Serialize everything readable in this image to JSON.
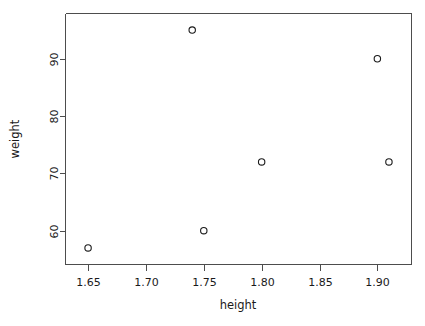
{
  "chart_data": {
    "type": "scatter",
    "title": "",
    "xlabel": "height",
    "ylabel": "weight",
    "x": [
      1.65,
      1.74,
      1.75,
      1.8,
      1.9,
      1.91
    ],
    "y": [
      57,
      95,
      60,
      72,
      90,
      72
    ],
    "points": [
      {
        "x": 1.65,
        "y": 57
      },
      {
        "x": 1.74,
        "y": 95
      },
      {
        "x": 1.75,
        "y": 60
      },
      {
        "x": 1.8,
        "y": 72
      },
      {
        "x": 1.9,
        "y": 90
      },
      {
        "x": 1.91,
        "y": 72
      }
    ],
    "xlim": [
      1.6305,
      1.9295
    ],
    "ylim": [
      54.1,
      97.9
    ],
    "xticks": [
      1.65,
      1.7,
      1.75,
      1.8,
      1.85,
      1.9
    ],
    "xtick_labels": [
      "1.65",
      "1.70",
      "1.75",
      "1.80",
      "1.85",
      "1.90"
    ],
    "yticks": [
      60,
      70,
      80,
      90
    ],
    "ytick_labels": [
      "60",
      "70",
      "80",
      "90"
    ],
    "grid": false,
    "legend": null,
    "marker": "open-circle",
    "marker_color": "#1a1a1a",
    "axis_color": "#4d4d4d",
    "background": "#ffffff"
  },
  "axes": {
    "x_title": "height",
    "y_title": "weight"
  }
}
